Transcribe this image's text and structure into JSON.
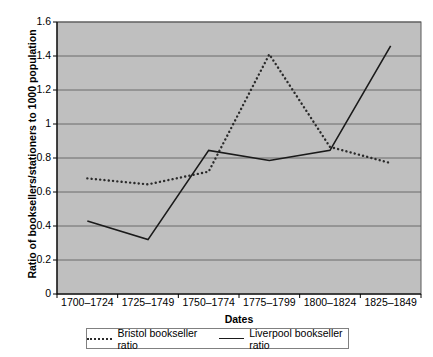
{
  "chart_data": {
    "type": "line",
    "title": "",
    "xlabel": "Dates",
    "ylabel": "Ratio of booksellers/stationers to 1000 population",
    "categories": [
      "1700–1724",
      "1725–1749",
      "1750–1774",
      "1775–1799",
      "1800–1824",
      "1825–1849"
    ],
    "ylim": [
      0,
      1.6
    ],
    "yticks": [
      "0",
      "0.2",
      "0.4",
      "0.6",
      "0.8",
      "1",
      "1.2",
      "1.4",
      "1.6"
    ],
    "ytick_values": [
      0,
      0.2,
      0.4,
      0.6,
      0.8,
      1.0,
      1.2,
      1.4,
      1.6
    ],
    "grid": true,
    "legend_position": "bottom",
    "plot_background": "#bfbfbf",
    "series": [
      {
        "name": "Bristol bookseller ratio",
        "style": "dotted",
        "color": "#2b2b2b",
        "values": [
          0.68,
          0.645,
          0.72,
          1.41,
          0.865,
          0.77
        ]
      },
      {
        "name": "Liverpool bookseller ratio",
        "style": "solid",
        "color": "#1a1a1a",
        "values": [
          0.43,
          0.32,
          0.845,
          0.785,
          0.845,
          1.46
        ]
      }
    ]
  }
}
